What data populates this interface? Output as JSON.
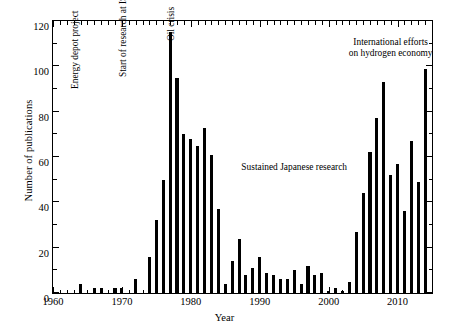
{
  "chart_data": {
    "type": "bar",
    "title": "",
    "xlabel": "Year",
    "ylabel": "Number of publications",
    "xlim": [
      1960,
      2015
    ],
    "ylim": [
      0,
      120
    ],
    "ytick_major": [
      0,
      20,
      40,
      60,
      80,
      100,
      120
    ],
    "ytick_minor_step": 10,
    "xtick_major": [
      1960,
      1970,
      1980,
      1990,
      2000,
      2010
    ],
    "xtick_minor_step": 1,
    "grid": false,
    "legend": null,
    "bar_color": "#000000",
    "categories": [
      1964,
      1965,
      1966,
      1967,
      1968,
      1969,
      1970,
      1971,
      1972,
      1973,
      1974,
      1975,
      1976,
      1977,
      1978,
      1979,
      1980,
      1981,
      1982,
      1983,
      1984,
      1985,
      1986,
      1987,
      1988,
      1989,
      1990,
      1991,
      1992,
      1993,
      1994,
      1995,
      1996,
      1997,
      1998,
      1999,
      2000,
      2001,
      2002,
      2003,
      2004,
      2005,
      2006,
      2007,
      2008,
      2009,
      2010,
      2011,
      2012,
      2013,
      2014
    ],
    "values": [
      4,
      0,
      2,
      2,
      0,
      2,
      2,
      0,
      6,
      0,
      16,
      32,
      50,
      115,
      95,
      70,
      68,
      65,
      73,
      61,
      37,
      4,
      14,
      24,
      8,
      11,
      16,
      9,
      8,
      6,
      6,
      10,
      4,
      12,
      8,
      9,
      1,
      2,
      1,
      5,
      27,
      44,
      62,
      77,
      93,
      52,
      57,
      36,
      67,
      49,
      99
    ],
    "annotations": [
      {
        "name": "energy-depot-project",
        "text": "Energy depot project",
        "orientation": "vertical",
        "x": 1964,
        "y": 95
      },
      {
        "name": "start-research-ispra",
        "text": "Start of research at ISPRA",
        "orientation": "vertical",
        "x": 1971,
        "y": 100
      },
      {
        "name": "oil-crisis",
        "text": "Oil crisis",
        "orientation": "vertical",
        "x": 1978,
        "y": 116
      },
      {
        "name": "sustained-japanese-research",
        "text": "Sustained Japanese research",
        "orientation": "horizontal",
        "x": 1995,
        "y": 58
      },
      {
        "name": "international-hydrogen-economy",
        "text": "International efforts\non hydrogen economy",
        "orientation": "horizontal",
        "x": 2009,
        "y": 113
      }
    ]
  },
  "axis": {
    "ylabel": "Number of publications",
    "xlabel": "Year",
    "ytick_labels": [
      "0",
      "20",
      "40",
      "60",
      "80",
      "100",
      "120"
    ],
    "xtick_labels": [
      "1960",
      "1970",
      "1980",
      "1990",
      "2000",
      "2010"
    ]
  },
  "annotation_text": {
    "energy_depot": "Energy depot project",
    "ispra": "Start of research at ISPRA",
    "oil_crisis": "Oil crisis",
    "japanese": "Sustained Japanese research",
    "international_line1": "International efforts",
    "international_line2": "on hydrogen economy"
  }
}
